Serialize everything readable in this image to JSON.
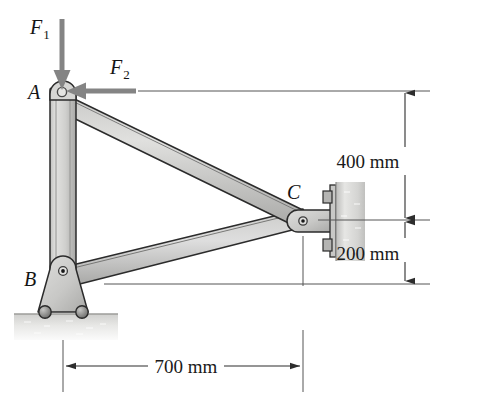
{
  "figure": {
    "background_color": "#ffffff"
  },
  "forces": [
    {
      "id": "F1",
      "base_label": "F",
      "subscript": "1",
      "direction": "down",
      "applied_at": "A",
      "color": "#808080"
    },
    {
      "id": "F2",
      "base_label": "F",
      "subscript": "2",
      "direction": "left",
      "applied_at": "A",
      "color": "#808080"
    }
  ],
  "joints": [
    {
      "id": "A",
      "label": "A",
      "type": "pin",
      "x": 62,
      "y": 91
    },
    {
      "id": "B",
      "label": "B",
      "type": "rocker-support",
      "x": 63,
      "y": 279
    },
    {
      "id": "C",
      "label": "C",
      "type": "wall-pin",
      "x": 305,
      "y": 220
    }
  ],
  "members": [
    {
      "id": "AB",
      "from": "A",
      "to": "B",
      "kind": "column"
    },
    {
      "id": "AC",
      "from": "A",
      "to": "C",
      "kind": "diagonal"
    },
    {
      "id": "BC",
      "from": "B",
      "to": "C",
      "kind": "diagonal"
    }
  ],
  "supports": {
    "ground": {
      "type": "hatched-ground",
      "at": "B"
    },
    "wall": {
      "type": "bolted-plate",
      "at": "C"
    }
  },
  "dimensions": [
    {
      "id": "dim-400",
      "label": "400 mm",
      "value": 400,
      "unit": "mm",
      "orientation": "vertical",
      "from_label": "A",
      "to_label": "C"
    },
    {
      "id": "dim-200",
      "label": "200 mm",
      "value": 200,
      "unit": "mm",
      "orientation": "vertical",
      "from_label": "C",
      "to_label": "B"
    },
    {
      "id": "dim-700",
      "label": "700 mm",
      "value": 700,
      "unit": "mm",
      "orientation": "horizontal",
      "from_label": "B",
      "to_label": "C"
    }
  ],
  "colors": {
    "member_fill_light": "#d8d8d6",
    "member_fill_mid": "#bcbcba",
    "member_fill_dark": "#9a9a98",
    "outline": "#2b2b2b",
    "force_arrow": "#848484",
    "dimension_line": "#3a3a3a",
    "ground_fill": "#dcdcdc",
    "wall_plate": "#d2d2d2"
  }
}
